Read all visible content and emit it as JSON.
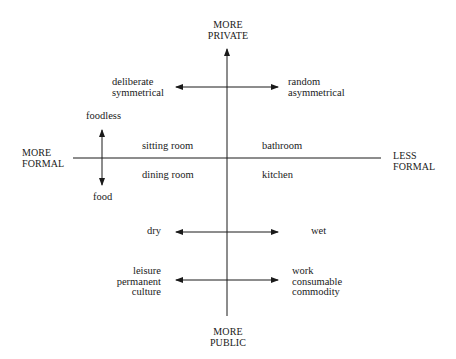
{
  "diagram": {
    "axes": {
      "top": [
        "MORE",
        "PRIVATE"
      ],
      "bottom": [
        "MORE",
        "PUBLIC"
      ],
      "left": [
        "MORE",
        "FORMAL"
      ],
      "right": [
        "LESS",
        "FORMAL"
      ]
    },
    "quadrant_labels": {
      "upper_left": "sitting room",
      "upper_right": "bathroom",
      "lower_left": "dining room",
      "lower_right": "kitchen"
    },
    "food_axis": {
      "top": "foodless",
      "bottom": "food"
    },
    "contrasts": [
      {
        "left": [
          "deliberate",
          "symmetrical"
        ],
        "right": [
          "random",
          "asymmetrical"
        ]
      },
      {
        "left": [
          "dry"
        ],
        "right": [
          "wet"
        ]
      },
      {
        "left": [
          "leisure",
          "permanent",
          "culture"
        ],
        "right": [
          "work",
          "consumable",
          "commodity"
        ]
      }
    ],
    "colors": {
      "ink": "#1a1a1a",
      "background": "#ffffff"
    }
  }
}
